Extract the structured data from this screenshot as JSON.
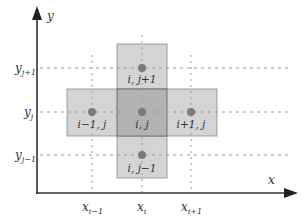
{
  "diagram": {
    "axes": {
      "x_label": "x",
      "y_label": "y"
    },
    "x_ticks": [
      {
        "base": "x",
        "sub": "i−1"
      },
      {
        "base": "x",
        "sub": "i"
      },
      {
        "base": "x",
        "sub": "i+1"
      }
    ],
    "y_ticks": [
      {
        "base": "y",
        "sub": "j+1"
      },
      {
        "base": "y",
        "sub": "j"
      },
      {
        "base": "y",
        "sub": "j−1"
      }
    ],
    "nodes": [
      {
        "id": "north",
        "label": "i, j+1"
      },
      {
        "id": "west",
        "label": "i−1, j"
      },
      {
        "id": "center",
        "label": "i, j"
      },
      {
        "id": "east",
        "label": "i+1, j"
      },
      {
        "id": "south",
        "label": "i, j−1"
      }
    ],
    "colors": {
      "cell_fill": "#d4d4d4",
      "center_fill": "#b3b3b3",
      "cell_border": "#8a8a8a",
      "node": "#7a7a7a",
      "axis": "#333333",
      "grid": "#9a9a9a"
    }
  }
}
